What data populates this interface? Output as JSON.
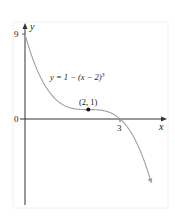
{
  "figure": {
    "equation_label": "y = 1 − (x − 2)",
    "equation_exponent": "3",
    "point_label": "(2, 1)",
    "x_axis_label": "x",
    "y_axis_label": "y",
    "y_tick_9": "9",
    "y_tick_0": "0",
    "x_tick_3": "3",
    "colors": {
      "axis": "#333333",
      "curve": "#a0a0a0",
      "point": "#111111",
      "frame": "#f2f2f2"
    }
  },
  "chart_data": {
    "type": "line",
    "title": "",
    "function": "y = 1 - (x - 2)^3",
    "xlabel": "x",
    "ylabel": "y",
    "x_ticks": [
      3
    ],
    "y_ticks": [
      0,
      9
    ],
    "highlighted_point": {
      "x": 2,
      "y": 1,
      "label": "(2, 1)"
    },
    "x": [
      0,
      0.5,
      1,
      1.5,
      2,
      2.5,
      3,
      3.5,
      3.97
    ],
    "y": [
      9,
      4.375,
      2,
      1.125,
      1,
      0.875,
      0,
      -2.375,
      -6.65
    ],
    "xlim": [
      0,
      4.5
    ],
    "ylim": [
      -9.2,
      9.8
    ],
    "grid": false
  }
}
